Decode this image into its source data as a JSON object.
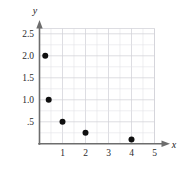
{
  "chart_data": {
    "type": "scatter",
    "title": "",
    "subtitle": "",
    "xlabel": "x",
    "ylabel": "y",
    "xlim": [
      0,
      5.2
    ],
    "ylim": [
      0,
      2.7
    ],
    "grid": true,
    "legend": null,
    "x_ticks": [
      1,
      2,
      3,
      4,
      5
    ],
    "x_tick_labels": [
      "1",
      "2",
      "3",
      "4",
      "5"
    ],
    "y_ticks": [
      0.5,
      1.0,
      1.5,
      2.0,
      2.5
    ],
    "y_tick_labels": [
      ".5",
      "1.0",
      "1.5",
      "2.0",
      "2.5"
    ],
    "grid_x_step": 0.5,
    "grid_y_step": 0.25,
    "points": [
      {
        "x": 0.25,
        "y": 2.0
      },
      {
        "x": 0.4,
        "y": 1.0
      },
      {
        "x": 1.0,
        "y": 0.5
      },
      {
        "x": 2.0,
        "y": 0.25
      },
      {
        "x": 4.0,
        "y": 0.1
      }
    ],
    "marker": "filled-circle",
    "marker_size": 3,
    "colors": {
      "marker": "#101010",
      "axis": "#6d6d6d",
      "grid_minor": "#e2e2e6",
      "grid_major": "#d2d2d8",
      "text": "#2b2b2b",
      "background": "#ffffff"
    }
  },
  "figure": {
    "axis_x_name": "x",
    "axis_y_name": "y"
  }
}
